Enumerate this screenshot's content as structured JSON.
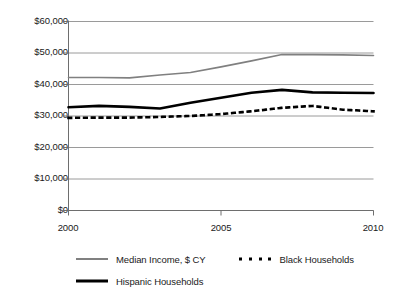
{
  "chart_data": {
    "type": "line",
    "title": "",
    "subtitle": "",
    "xlabel": "",
    "ylabel": "",
    "xlim": [
      2000,
      2010
    ],
    "ylim": [
      0,
      60000
    ],
    "grid": true,
    "grid_axis": "y",
    "legend_position": "bottom",
    "x": [
      2000,
      2001,
      2002,
      2003,
      2004,
      2005,
      2006,
      2007,
      2008,
      2009,
      2010
    ],
    "xticks": [
      2000,
      2005,
      2010
    ],
    "xtick_labels": [
      "2000",
      "2005",
      "2010"
    ],
    "yticks": [
      0,
      10000,
      20000,
      30000,
      40000,
      50000,
      60000
    ],
    "ytick_labels": [
      "$0",
      "$10,000",
      "$20,000",
      "$30,000",
      "$40,000",
      "$50,000",
      "$60,000"
    ],
    "series": [
      {
        "name": "Median Income, $ CY",
        "style": "solid",
        "color": "#808080",
        "width": 1.6,
        "values": [
          42200,
          42200,
          42100,
          43000,
          43800,
          45600,
          47500,
          49500,
          49500,
          49400,
          49200
        ]
      },
      {
        "name": "Black Households",
        "style": "dotted",
        "color": "#000000",
        "width": 2.6,
        "values": [
          29400,
          29500,
          29500,
          29700,
          30000,
          30600,
          31500,
          32600,
          33200,
          32000,
          31500
        ]
      },
      {
        "name": "Hispanic Households",
        "style": "solid",
        "color": "#000000",
        "width": 2.6,
        "values": [
          32800,
          33200,
          32900,
          32400,
          34200,
          35800,
          37400,
          38300,
          37500,
          37400,
          37300
        ]
      }
    ]
  },
  "axis": {
    "y_tick_labels": [
      "$60,000",
      "$50,000",
      "$40,000",
      "$30,000",
      "$20,000",
      "$10,000",
      "$0"
    ],
    "x_tick_labels": [
      "2000",
      "2005",
      "2010"
    ]
  },
  "legend": {
    "items": [
      {
        "label": "Median Income, $ CY",
        "marker": "solid-gray-line-icon"
      },
      {
        "label": "Black Households",
        "marker": "dotted-black-line-icon"
      },
      {
        "label": "Hispanic Households",
        "marker": "solid-black-line-icon"
      }
    ]
  }
}
